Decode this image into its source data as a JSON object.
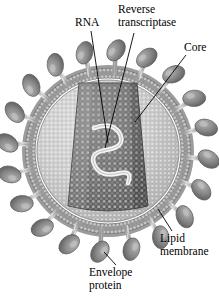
{
  "figure": {
    "background_color": "#ffffff",
    "width": 219,
    "height": 304
  },
  "labels": {
    "rna": "RNA",
    "reverse_transcriptase_line1": "Reverse",
    "reverse_transcriptase_line2": "transcriptase",
    "core": "Core",
    "lipid_membrane_line1": "Lipid",
    "lipid_membrane_line2": "membrane",
    "envelope_protein_line1": "Envelope",
    "envelope_protein_line2": "protein"
  },
  "diagram": {
    "type": "virus-cross-section",
    "virion": {
      "center_x": 108,
      "center_y": 151,
      "radius": 82,
      "matrix_color": "#c8c8c8",
      "membrane_color": "#9a9a9a"
    },
    "core": {
      "shape": "truncated-cone",
      "color": "#6e6e6e",
      "dot_color": "#b9b9b9"
    },
    "rna": {
      "shape": "squiggle",
      "color": "#f2f2f2"
    },
    "envelope_proteins": {
      "count": 20,
      "shape": "ellipse-on-stalk",
      "color": "#8c8c8c"
    },
    "lipid_membrane": {
      "shape": "dotted-bilayer-ring",
      "color": "#8f8f8f"
    },
    "colors": {
      "ink": "#000000",
      "dark_gray": "#6e6e6e",
      "mid_gray": "#9a9a9a",
      "light_gray": "#c8c8c8",
      "pale_gray": "#dcdcdc"
    }
  }
}
